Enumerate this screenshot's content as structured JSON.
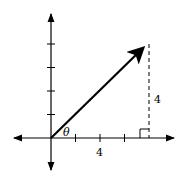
{
  "diagram": {
    "axes": {
      "x_tick_count_positive": 4,
      "y_tick_count_positive": 4,
      "x_tick_label": "4",
      "arrows": [
        "left",
        "right",
        "up",
        "down"
      ]
    },
    "vector": {
      "from": [
        0,
        0
      ],
      "to": [
        4,
        4
      ],
      "units": "tick units scaled: 4 ticks on y-axis = 4"
    },
    "angle_label": "θ",
    "vertical_leg_label": "4",
    "right_angle_marker": true,
    "colors": {
      "stroke": "#000000",
      "background": "#ffffff"
    }
  }
}
